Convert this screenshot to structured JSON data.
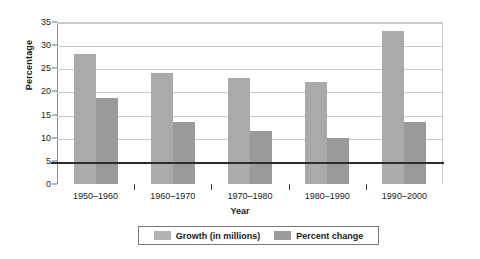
{
  "chart_data": {
    "type": "bar",
    "title": "",
    "xlabel": "Year",
    "ylabel": "Percentage",
    "categories": [
      "1950–1960",
      "1960–1970",
      "1970–1980",
      "1980–1990",
      "1990–2000"
    ],
    "series": [
      {
        "name": "Growth (in millions)",
        "color": "#aaaaaa",
        "values": [
          28,
          24,
          23,
          22,
          33
        ]
      },
      {
        "name": "Percent change",
        "color": "#9a9a9a",
        "values": [
          18.5,
          13.5,
          11.5,
          10,
          13.5
        ]
      }
    ],
    "ylim": [
      0,
      35
    ],
    "ytick_labels": [
      "0",
      "5",
      "10",
      "15",
      "20",
      "25",
      "30",
      "35"
    ],
    "ytick_values": [
      0,
      5,
      10,
      15,
      20,
      25,
      30,
      35
    ],
    "grid": true,
    "legend_position": "bottom"
  }
}
